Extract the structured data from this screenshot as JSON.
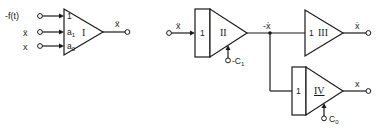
{
  "diagram": {
    "type": "analog-computer-block-diagram",
    "colors": {
      "line": "#1a1a1a",
      "background": "#ffffff"
    },
    "left_circuit": {
      "amplifier": {
        "id": "I",
        "label": "I",
        "inputs": [
          {
            "signal": "-f(t)",
            "gain": "1"
          },
          {
            "signal": "ẍ",
            "gain": "a",
            "gain_sub": "1"
          },
          {
            "signal": "x",
            "gain": "a",
            "gain_sub": "0"
          }
        ],
        "output": "ẍ"
      }
    },
    "right_circuit": {
      "integrator_II": {
        "label": "II",
        "input": "ẍ",
        "gain": "1",
        "initial_condition": "-C",
        "initial_condition_sub": "1",
        "output": "-ẋ"
      },
      "amplifier_III": {
        "label": "III",
        "gain": "1",
        "output": "ẋ"
      },
      "integrator_IV": {
        "label": "IV",
        "gain": "1",
        "initial_condition": "C",
        "initial_condition_sub": "0",
        "output": "x"
      }
    }
  }
}
